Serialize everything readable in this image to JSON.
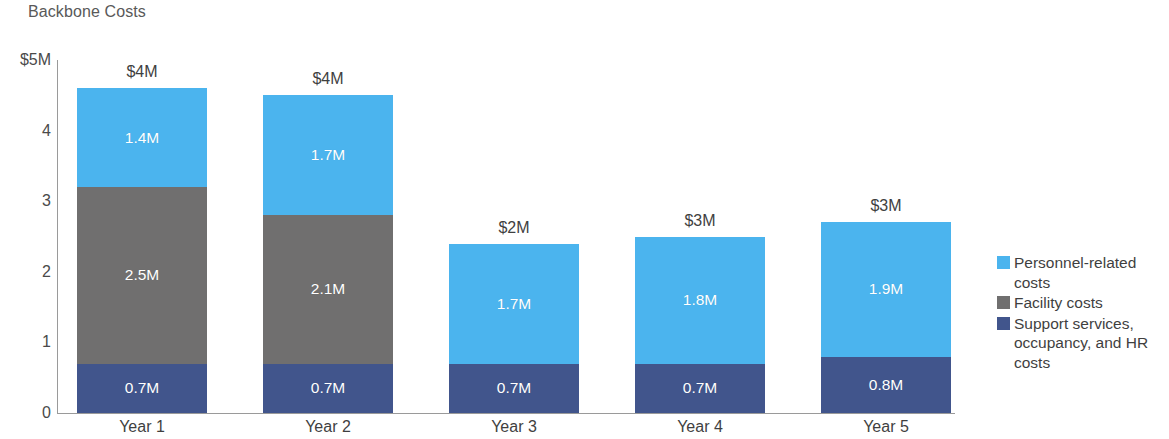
{
  "chart_data": {
    "type": "bar",
    "subtype": "stacked-vertical",
    "title": "Backbone Costs",
    "xlabel": "",
    "ylabel": "",
    "ylim": [
      0,
      5
    ],
    "grid": false,
    "legend_position": "right",
    "categories": [
      "Year 1",
      "Year 2",
      "Year 3",
      "Year 4",
      "Year 5"
    ],
    "y_ticks": [
      {
        "value": 5,
        "label": "$5M"
      },
      {
        "value": 4,
        "label": "4"
      },
      {
        "value": 3,
        "label": "3"
      },
      {
        "value": 2,
        "label": "2"
      },
      {
        "value": 1,
        "label": "1"
      },
      {
        "value": 0,
        "label": "0"
      }
    ],
    "series": [
      {
        "name": "Support services, occupancy, and HR costs",
        "color": "#41558C",
        "values": [
          0.7,
          0.7,
          0.7,
          0.7,
          0.8
        ],
        "labels": [
          "0.7M",
          "0.7M",
          "0.7M",
          "0.7M",
          "0.8M"
        ]
      },
      {
        "name": "Facility costs",
        "color": "#706F6F",
        "values": [
          2.5,
          2.1,
          0,
          0,
          0
        ],
        "labels": [
          "2.5M",
          "2.1M",
          "",
          "",
          ""
        ]
      },
      {
        "name": "Personnel-related costs",
        "color": "#4BB4EE",
        "values": [
          1.4,
          1.7,
          1.7,
          1.8,
          1.9
        ],
        "labels": [
          "1.4M",
          "1.7M",
          "1.7M",
          "1.8M",
          "1.9M"
        ]
      }
    ],
    "totals": [
      4.6,
      4.5,
      2.4,
      2.5,
      2.7
    ],
    "total_labels": [
      "$4M",
      "$4M",
      "$2M",
      "$3M",
      "$3M"
    ]
  },
  "legend": {
    "items": [
      {
        "label": "Personnel-related costs",
        "color": "#4BB4EE"
      },
      {
        "label": "Facility costs",
        "color": "#706F6F"
      },
      {
        "label": "Support services, occupancy, and HR costs",
        "color": "#41558C"
      }
    ]
  },
  "colors": {
    "personnel": "#4BB4EE",
    "facility": "#706F6F",
    "support": "#41558C",
    "axis": "#9a9a9a",
    "title_text": "#595959",
    "tick_text": "#4a4a4a"
  }
}
